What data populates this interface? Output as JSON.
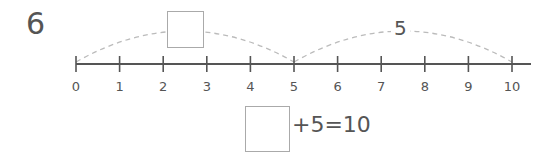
{
  "question": {
    "number": "6"
  },
  "number_line": {
    "min": 0,
    "max": 10,
    "tick_labels": [
      "0",
      "1",
      "2",
      "3",
      "4",
      "5",
      "6",
      "7",
      "8",
      "9",
      "10"
    ],
    "line_color": "#555555",
    "arc_color": "#bbbbbb"
  },
  "jumps": [
    {
      "from": 0,
      "to": 5,
      "label": "",
      "is_blank": true
    },
    {
      "from": 5,
      "to": 10,
      "label": "5",
      "is_blank": false
    }
  ],
  "equation": {
    "blank_value": "",
    "text": "+5=10"
  }
}
